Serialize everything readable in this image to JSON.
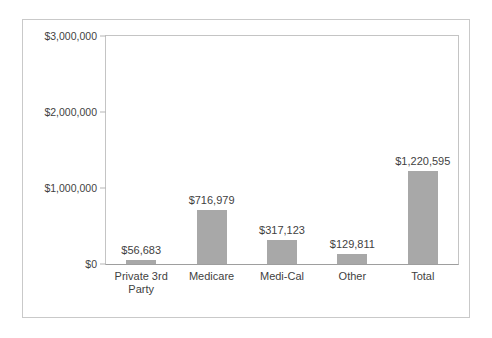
{
  "chart_data": {
    "type": "bar",
    "title": "",
    "subtitle": "",
    "xlabel": "",
    "ylabel": "",
    "categories": [
      "Private 3rd Party",
      "Medicare",
      "Medi-Cal",
      "Other",
      "Total"
    ],
    "category_lines": [
      [
        "Private 3rd",
        "Party"
      ],
      [
        "Medicare"
      ],
      [
        "Medi-Cal"
      ],
      [
        "Other"
      ],
      [
        "Total"
      ]
    ],
    "values": [
      56683,
      716979,
      317123,
      129811,
      1220595
    ],
    "data_labels": [
      "$56,683",
      "$716,979",
      "$317,123",
      "$129,811",
      "$1,220,595"
    ],
    "ylim": [
      0,
      3000000
    ],
    "ytick_values": [
      0,
      1000000,
      2000000,
      3000000
    ],
    "ytick_labels": [
      "$0",
      "$1,000,000",
      "$2,000,000",
      "$3,000,000"
    ],
    "grid": false,
    "legend": "none",
    "bar_color": "#a8a8a8",
    "plot_border_color": "#c4c4c4",
    "frame_border_color": "#c9c9c9",
    "background_color": "#ffffff",
    "text_color": "#3f3f3f"
  }
}
